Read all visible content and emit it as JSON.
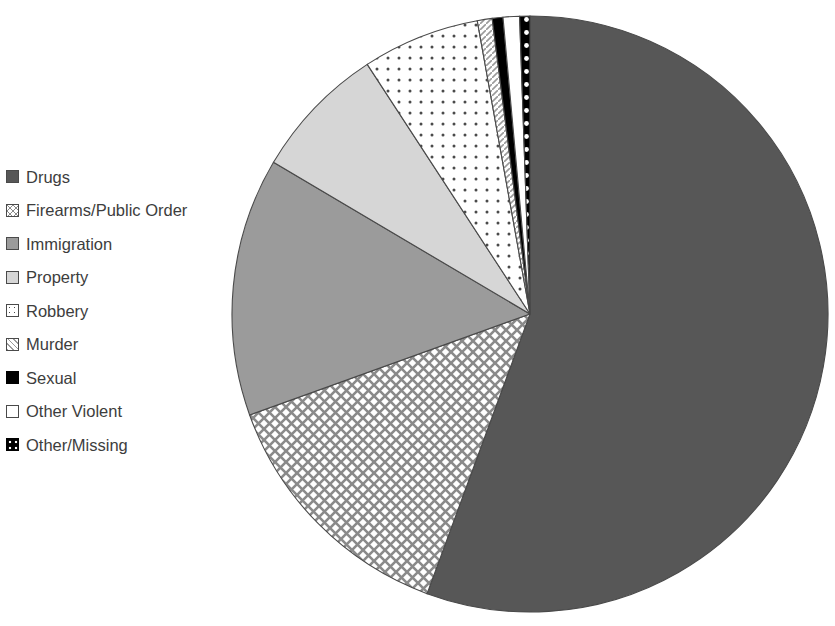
{
  "chart_data": {
    "type": "pie",
    "title": "",
    "subtitle": "",
    "xlabel": "",
    "ylabel": "",
    "legend_position": "left",
    "grid": false,
    "categories": [
      "Drugs",
      "Firearms/Public Order",
      "Immigration",
      "Property",
      "Robbery",
      "Murder",
      "Sexual",
      "Other Violent",
      "Other/Missing"
    ],
    "values": [
      55.6,
      13.9,
      14.0,
      7.3,
      6.4,
      0.8,
      0.6,
      0.9,
      0.5
    ],
    "units": "percent",
    "slices": [
      {
        "label": "Drugs",
        "value": 55.6,
        "start_angle_deg": 0.0,
        "end_angle_deg": 200.2,
        "fill": "solid",
        "color": "#575757",
        "pattern_color": "#575757"
      },
      {
        "label": "Firearms/Public Order",
        "value": 13.9,
        "start_angle_deg": 200.2,
        "end_angle_deg": 250.2,
        "fill": "cross-hatch",
        "color": "#ffffff",
        "pattern_color": "#8a8a8a"
      },
      {
        "label": "Immigration",
        "value": 14.0,
        "start_angle_deg": 250.2,
        "end_angle_deg": 300.6,
        "fill": "solid",
        "color": "#9b9b9b",
        "pattern_color": "#9b9b9b"
      },
      {
        "label": "Property",
        "value": 7.3,
        "start_angle_deg": 300.6,
        "end_angle_deg": 326.9,
        "fill": "solid",
        "color": "#d6d6d6",
        "pattern_color": "#d6d6d6"
      },
      {
        "label": "Robbery",
        "value": 6.4,
        "start_angle_deg": 326.9,
        "end_angle_deg": 349.8,
        "fill": "dots",
        "color": "#ffffff",
        "pattern_color": "#4a4a4a"
      },
      {
        "label": "Murder",
        "value": 0.8,
        "start_angle_deg": 349.8,
        "end_angle_deg": 352.7,
        "fill": "diagonal-hatch",
        "color": "#ffffff",
        "pattern_color": "#9b9b9b"
      },
      {
        "label": "Sexual",
        "value": 0.6,
        "start_angle_deg": 352.7,
        "end_angle_deg": 354.8,
        "fill": "solid",
        "color": "#000000",
        "pattern_color": "#000000"
      },
      {
        "label": "Other Violent",
        "value": 0.9,
        "start_angle_deg": 354.8,
        "end_angle_deg": 358.0,
        "fill": "solid",
        "color": "#ffffff",
        "pattern_color": "#ffffff"
      },
      {
        "label": "Other/Missing",
        "value": 0.5,
        "start_angle_deg": 358.0,
        "end_angle_deg": 360.0,
        "fill": "black-with-white-dots",
        "color": "#000000",
        "pattern_color": "#ffffff"
      }
    ],
    "geometry": {
      "center_x": 530,
      "center_y": 314,
      "radius": 298
    }
  },
  "legend": {
    "items": [
      {
        "label": "Drugs",
        "swatch": "swatch-solid-dark-gray"
      },
      {
        "label": "Firearms/Public Order",
        "swatch": "swatch-cross-hatch"
      },
      {
        "label": "Immigration",
        "swatch": "swatch-solid-mid-gray"
      },
      {
        "label": "Property",
        "swatch": "swatch-solid-light-gray"
      },
      {
        "label": "Robbery",
        "swatch": "swatch-dots"
      },
      {
        "label": "Murder",
        "swatch": "swatch-diagonal-hatch"
      },
      {
        "label": "Sexual",
        "swatch": "swatch-solid-black"
      },
      {
        "label": "Other Violent",
        "swatch": "swatch-white"
      },
      {
        "label": "Other/Missing",
        "swatch": "swatch-black-white-dots"
      }
    ]
  },
  "colors": {
    "drugs": "#575757",
    "immigration": "#9b9b9b",
    "property": "#d6d6d6",
    "sexual": "#000000",
    "other_violent": "#ffffff",
    "outline": "#4a4a4a",
    "legend_text": "#3d3d3d"
  }
}
